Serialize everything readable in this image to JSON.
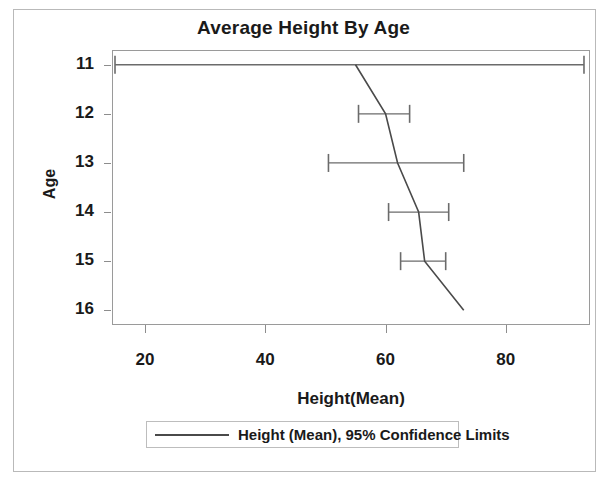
{
  "chart_data": {
    "type": "line",
    "title": "Average Height By Age",
    "xlabel": "Height(Mean)",
    "ylabel": "Age",
    "orientation": "horizontal",
    "grid": false,
    "legend_position": "bottom",
    "xlim": [
      14.5,
      94
    ],
    "ylim": [
      10.7,
      16.3
    ],
    "xticks": [
      20,
      40,
      60,
      80
    ],
    "xtick_labels": [
      "20",
      "40",
      "60",
      "80"
    ],
    "yticks": [
      11,
      12,
      13,
      14,
      15,
      16
    ],
    "ytick_labels": [
      "11",
      "12",
      "13",
      "14",
      "15",
      "16"
    ],
    "categories": [
      11,
      12,
      13,
      14,
      15,
      16
    ],
    "series": [
      {
        "name": "Height (Mean), 95% Confidence Limits",
        "values": [
          55.0,
          60.0,
          62.0,
          65.5,
          66.5,
          73.0
        ],
        "ci_lower": [
          15.0,
          55.5,
          50.5,
          60.5,
          62.5,
          null
        ],
        "ci_upper": [
          93.0,
          64.0,
          73.0,
          70.5,
          70.0,
          null
        ]
      }
    ],
    "points": [
      {
        "age": 11,
        "mean": 55.0,
        "ci_lower": 15.0,
        "ci_upper": 93.0
      },
      {
        "age": 12,
        "mean": 60.0,
        "ci_lower": 55.5,
        "ci_upper": 64.0
      },
      {
        "age": 13,
        "mean": 62.0,
        "ci_lower": 50.5,
        "ci_upper": 73.0
      },
      {
        "age": 14,
        "mean": 65.5,
        "ci_lower": 60.5,
        "ci_upper": 70.5
      },
      {
        "age": 15,
        "mean": 66.5,
        "ci_lower": 62.5,
        "ci_upper": 70.0
      },
      {
        "age": 16,
        "mean": 73.0,
        "ci_lower": null,
        "ci_upper": null
      }
    ],
    "colors": {
      "line": "#4a4a4a",
      "errorbar": "#6b6b6b",
      "axis": "#9a9a9a",
      "text": "#1a1a1a"
    }
  },
  "legend": {
    "entries": [
      {
        "label": "Height (Mean), 95% Confidence Limits"
      }
    ]
  }
}
